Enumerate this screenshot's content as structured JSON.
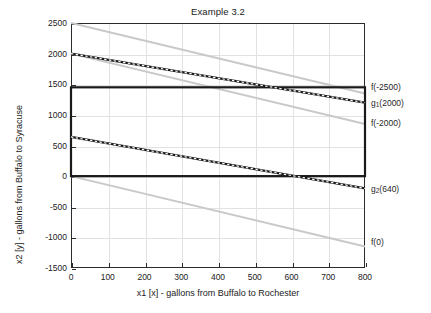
{
  "chart_data": {
    "type": "line",
    "title": "Example 3.2",
    "xlabel": "x1 [x] - gallons from Buffalo to Rochester",
    "ylabel": "x2 [y] - gallons from Buffalo to Syracuse",
    "xlim": [
      0,
      800
    ],
    "ylim": [
      -1500,
      2500
    ],
    "xticks": [
      0,
      100,
      200,
      300,
      400,
      500,
      600,
      700,
      800
    ],
    "yticks": [
      2500,
      2000,
      1500,
      1000,
      500,
      0,
      -500,
      -1000,
      -1500
    ],
    "grid": true,
    "legend_position": "right-outside-annotations",
    "colors": {
      "constraint": "#1a1a1a",
      "objective": "#c9c9c9",
      "feasible_border": "#1a1a1a",
      "grid": "#e2e2e2",
      "axis": "#2b2b2b"
    },
    "series": [
      {
        "name": "f(-2500)",
        "label": "f(-2500)",
        "style": "solid",
        "color": "#c9c9c9",
        "role": "objective-isoline",
        "x": [
          0,
          800
        ],
        "values": [
          2500,
          1350
        ]
      },
      {
        "name": "g1",
        "label": "g_1(2000)",
        "label_base": "g",
        "label_sub": "1",
        "label_tail": "(2000)",
        "style": "dashed-over-solid",
        "color": "#1a1a1a",
        "role": "constraint",
        "x": [
          0,
          800
        ],
        "values": [
          2000,
          1200
        ]
      },
      {
        "name": "f(-2000)",
        "label": "f(-2000)",
        "style": "solid",
        "color": "#c9c9c9",
        "role": "objective-isoline",
        "x": [
          0,
          800
        ],
        "values": [
          2000,
          850
        ]
      },
      {
        "name": "g2",
        "label": "g_2(640)",
        "label_base": "g",
        "label_sub": "2",
        "label_tail": "(640)",
        "style": "dashed-over-solid",
        "color": "#1a1a1a",
        "role": "constraint",
        "x": [
          0,
          800
        ],
        "values": [
          640,
          -200
        ]
      },
      {
        "name": "f(0)",
        "label": "f(0)",
        "style": "solid",
        "color": "#c9c9c9",
        "role": "objective-isoline",
        "x": [
          0,
          800
        ],
        "values": [
          0,
          -1150
        ]
      }
    ],
    "feasible_region": {
      "name": "feasible-region-boundary",
      "style": "solid",
      "color": "#1a1a1a",
      "x_range": [
        0,
        800
      ],
      "y_top": 1450,
      "y_bottom": 0
    },
    "annotations": [
      {
        "name": "annot-f-2500",
        "text": "f(-2500)",
        "y": 1450,
        "type": "plain"
      },
      {
        "name": "annot-g1",
        "text": "g1(2000)",
        "y": 1200,
        "type": "subscript",
        "base": "g",
        "sub": "1",
        "tail": "(2000)"
      },
      {
        "name": "annot-f-2000",
        "text": "f(-2000)",
        "y": 870,
        "type": "plain"
      },
      {
        "name": "annot-g2",
        "text": "g2(640)",
        "y": -215,
        "type": "subscript",
        "base": "g",
        "sub": "2",
        "tail": "(640)"
      },
      {
        "name": "annot-f-0",
        "text": "f(0)",
        "y": -1080,
        "type": "plain"
      }
    ]
  }
}
